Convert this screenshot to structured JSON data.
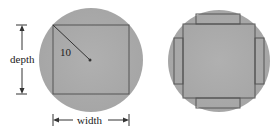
{
  "figure_left": {
    "radius_label": "10",
    "depth_label": "depth",
    "width_label": "width"
  },
  "figure_right": {
    "description": "circle with inscribed square and four side rectangles"
  },
  "colors": {
    "disk": "#a9a9a9",
    "lines": "#555555",
    "text": "#222222"
  }
}
